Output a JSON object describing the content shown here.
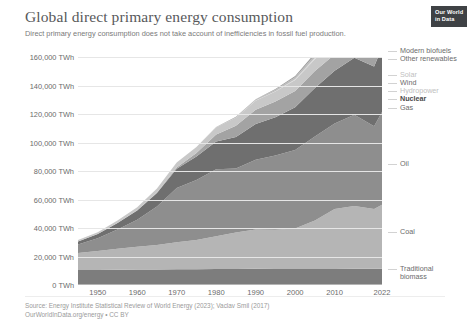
{
  "header": {
    "title": "Global direct primary energy consumption",
    "subtitle": "Direct primary energy consumption does not take account of inefficiencies in fossil fuel production."
  },
  "logo": {
    "line1": "Our World",
    "line2": "in Data"
  },
  "footer": {
    "source": "Source: Energy Institute Statistical Review of World Energy (2023); Vaclav Smil (2017)",
    "license": "OurWorldInData.org/energy • CC BY"
  },
  "chart_data": {
    "type": "area",
    "stacked": true,
    "title": "Global direct primary energy consumption",
    "subtitle": "Direct primary energy consumption does not take account of inefficiencies in fossil fuel production.",
    "xlabel": "",
    "ylabel": "",
    "unit": "TWh",
    "xlim": [
      1945,
      2022
    ],
    "ylim": [
      0,
      160000
    ],
    "grid": true,
    "legend_position": "right-inline",
    "ytick_labels": [
      "160,000 TWh",
      "140,000 TWh",
      "120,000 TWh",
      "100,000 TWh",
      "80,000 TWh",
      "60,000 TWh",
      "40,000 TWh",
      "20,000 TWh",
      "0 TWh"
    ],
    "ytick_values": [
      160000,
      140000,
      120000,
      100000,
      80000,
      60000,
      40000,
      20000,
      0
    ],
    "xtick_labels": [
      "1950",
      "1960",
      "1970",
      "1980",
      "1990",
      "2000",
      "2010",
      "2022"
    ],
    "xtick_values": [
      1950,
      1960,
      1970,
      1980,
      1990,
      2000,
      2010,
      2022
    ],
    "x": [
      1945,
      1950,
      1955,
      1960,
      1965,
      1970,
      1975,
      1980,
      1985,
      1990,
      1995,
      2000,
      2005,
      2010,
      2015,
      2020,
      2022
    ],
    "series": [
      {
        "name": "Traditional biomass",
        "color": "#7d7d7d",
        "values": [
          10500,
          10600,
          10700,
          10800,
          10900,
          11000,
          11100,
          11200,
          11300,
          11400,
          11300,
          11200,
          11200,
          11300,
          11400,
          11400,
          11400
        ]
      },
      {
        "name": "Coal",
        "color": "#b5b5b5",
        "values": [
          12000,
          13200,
          14800,
          16000,
          17200,
          19000,
          20500,
          23000,
          25500,
          27500,
          27500,
          28500,
          34000,
          42000,
          44000,
          42000,
          45000
        ]
      },
      {
        "name": "Oil",
        "color": "#8e8e8e",
        "values": [
          6000,
          9000,
          13500,
          19000,
          27000,
          38000,
          42000,
          47000,
          45000,
          49000,
          52000,
          55000,
          59000,
          60000,
          64000,
          58000,
          65000
        ]
      },
      {
        "name": "Gas",
        "color": "#6f6f6f",
        "values": [
          2000,
          3000,
          4500,
          6500,
          9500,
          13500,
          16500,
          19500,
          22000,
          25000,
          27000,
          30000,
          34000,
          37000,
          40000,
          42000,
          45000
        ]
      },
      {
        "name": "Nuclear",
        "color": "#a3a3a3",
        "values": [
          0,
          0,
          0,
          100,
          400,
          1000,
          2500,
          5000,
          8000,
          10000,
          11000,
          11500,
          12000,
          11500,
          10500,
          10800,
          11000
        ]
      },
      {
        "name": "Hydropower",
        "color": "#c8c8c8",
        "values": [
          1000,
          1300,
          1700,
          2200,
          2800,
          3500,
          4200,
          4800,
          5600,
          6400,
          7000,
          7700,
          8200,
          9500,
          10500,
          11000,
          11300
        ]
      },
      {
        "name": "Wind",
        "color": "#d6d6d6",
        "values": [
          0,
          0,
          0,
          0,
          0,
          0,
          0,
          0,
          0,
          100,
          200,
          500,
          1000,
          2200,
          5000,
          9000,
          11000
        ]
      },
      {
        "name": "Solar",
        "color": "#e0e0e0",
        "values": [
          0,
          0,
          0,
          0,
          0,
          0,
          0,
          0,
          0,
          0,
          0,
          50,
          150,
          500,
          1800,
          5000,
          7000
        ]
      },
      {
        "name": "Other renewables",
        "color": "#bdbdbd",
        "values": [
          0,
          0,
          0,
          0,
          0,
          0,
          100,
          200,
          400,
          700,
          1000,
          1400,
          1800,
          2400,
          3200,
          3800,
          4200
        ]
      },
      {
        "name": "Modern biofuels",
        "color": "#9c9c9c",
        "values": [
          0,
          0,
          0,
          0,
          0,
          0,
          0,
          100,
          200,
          300,
          500,
          800,
          1300,
          2200,
          2800,
          3000,
          3200
        ]
      }
    ],
    "annotations": []
  },
  "legend": [
    {
      "label": "Modern biofuels",
      "emphasis": "normal"
    },
    {
      "label": "Other renewables",
      "emphasis": "normal"
    },
    {
      "label": "Solar",
      "emphasis": "faint"
    },
    {
      "label": "Wind",
      "emphasis": "normal"
    },
    {
      "label": "Hydropower",
      "emphasis": "faint"
    },
    {
      "label": "Nuclear",
      "emphasis": "bold"
    },
    {
      "label": "Gas",
      "emphasis": "normal"
    },
    {
      "label": "Oil",
      "emphasis": "normal"
    },
    {
      "label": "Coal",
      "emphasis": "normal"
    },
    {
      "label": "Traditional biomass",
      "emphasis": "normal"
    }
  ]
}
